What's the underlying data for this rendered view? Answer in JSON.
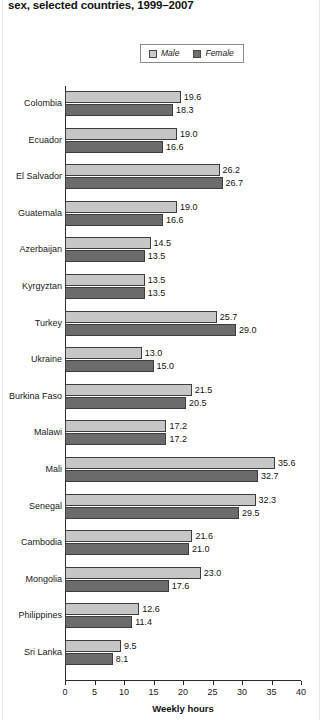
{
  "title": {
    "text": "sex, selected countries, 1999–2007"
  },
  "legend": {
    "items": [
      {
        "label": "Male",
        "color": "#c6c6c6",
        "name": "male"
      },
      {
        "label": "Female",
        "color": "#6b6b6b",
        "name": "female"
      }
    ]
  },
  "axis": {
    "x_title": "Weekly hours",
    "ticks": [
      "0",
      "5",
      "10",
      "15",
      "20",
      "25",
      "30",
      "35",
      "40"
    ]
  },
  "chart_data": {
    "type": "bar",
    "orientation": "horizontal",
    "title": "sex, selected countries, 1999–2007",
    "xlabel": "Weekly hours",
    "ylabel": "",
    "xlim": [
      0,
      40
    ],
    "xticks": [
      0,
      5,
      10,
      15,
      20,
      25,
      30,
      35,
      40
    ],
    "grid": false,
    "legend_position": "top-center",
    "categories": [
      "Colombia",
      "Ecuador",
      "El Salvador",
      "Guatemala",
      "Azerbaijan",
      "Kyrgyztan",
      "Turkey",
      "Ukraine",
      "Burkina Faso",
      "Malawi",
      "Mali",
      "Senegal",
      "Cambodia",
      "Mongolia",
      "Philippines",
      "Sri Lanka"
    ],
    "series": [
      {
        "name": "Male",
        "color": "#c6c6c6",
        "values": [
          19.6,
          19.0,
          26.2,
          19.0,
          14.5,
          13.5,
          25.7,
          13.0,
          21.5,
          17.2,
          35.6,
          32.3,
          21.6,
          23.0,
          12.6,
          9.5
        ],
        "labels": [
          "19.6",
          "19.0",
          "26.2",
          "19.0",
          "14.5",
          "13.5",
          "25.7",
          "13.0",
          "21.5",
          "17.2",
          "35.6",
          "32.3",
          "21.6",
          "23.0",
          "12.6",
          "9.5"
        ]
      },
      {
        "name": "Female",
        "color": "#6b6b6b",
        "values": [
          18.3,
          16.6,
          26.7,
          16.6,
          13.5,
          13.5,
          29.0,
          15.0,
          20.5,
          17.2,
          32.7,
          29.5,
          21.0,
          17.6,
          11.4,
          8.1
        ],
        "labels": [
          "18.3",
          "16.6",
          "26.7",
          "16.6",
          "13.5",
          "13.5",
          "29.0",
          "15.0",
          "20.5",
          "17.2",
          "32.7",
          "29.5",
          "21.0",
          "17.6",
          "11.4",
          "8.1"
        ]
      }
    ]
  }
}
